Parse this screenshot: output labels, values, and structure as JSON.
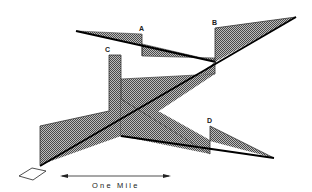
{
  "diagram": {
    "labels": {
      "a": "A",
      "b": "B",
      "c": "C",
      "d": "D"
    },
    "scale_bar": {
      "label": "One Mile"
    },
    "colors": {
      "line": "#000000",
      "hatch_dark": "#555555",
      "hatch_light": "#bbbbbb",
      "background": "#ffffff"
    }
  }
}
